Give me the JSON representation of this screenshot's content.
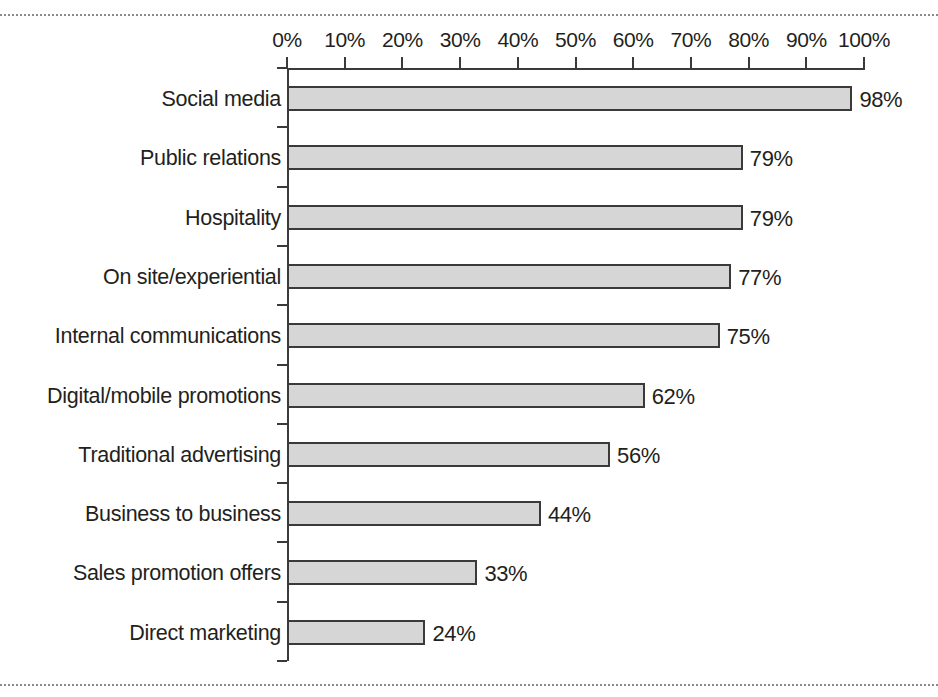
{
  "chart_data": {
    "type": "bar",
    "orientation": "horizontal",
    "title": "",
    "subtitle": "",
    "xlabel": "",
    "ylabel": "",
    "xlim": [
      0,
      100
    ],
    "grid": false,
    "legend": null,
    "unit": "%",
    "categories": [
      "Social media",
      "Public relations",
      "Hospitality",
      "On site/experiential",
      "Internal communications",
      "Digital/mobile promotions",
      "Traditional advertising",
      "Business to business",
      "Sales promotion offers",
      "Direct marketing"
    ],
    "values": [
      98,
      79,
      79,
      77,
      75,
      62,
      56,
      44,
      33,
      24
    ],
    "value_labels": [
      "98%",
      "79%",
      "79%",
      "77%",
      "75%",
      "62%",
      "56%",
      "44%",
      "33%",
      "24%"
    ],
    "xticks": [
      0,
      10,
      20,
      30,
      40,
      50,
      60,
      70,
      80,
      90,
      100
    ],
    "xtick_labels": [
      "0%",
      "10%",
      "20%",
      "30%",
      "40%",
      "50%",
      "60%",
      "70%",
      "80%",
      "90%",
      "100%"
    ],
    "colors": {
      "bar_fill": "#d6d6d6",
      "bar_stroke": "#3a3a3a",
      "axis": "#3a3a3a",
      "text": "#231f20",
      "rule": "#8a8a8a",
      "background": "#ffffff"
    }
  }
}
